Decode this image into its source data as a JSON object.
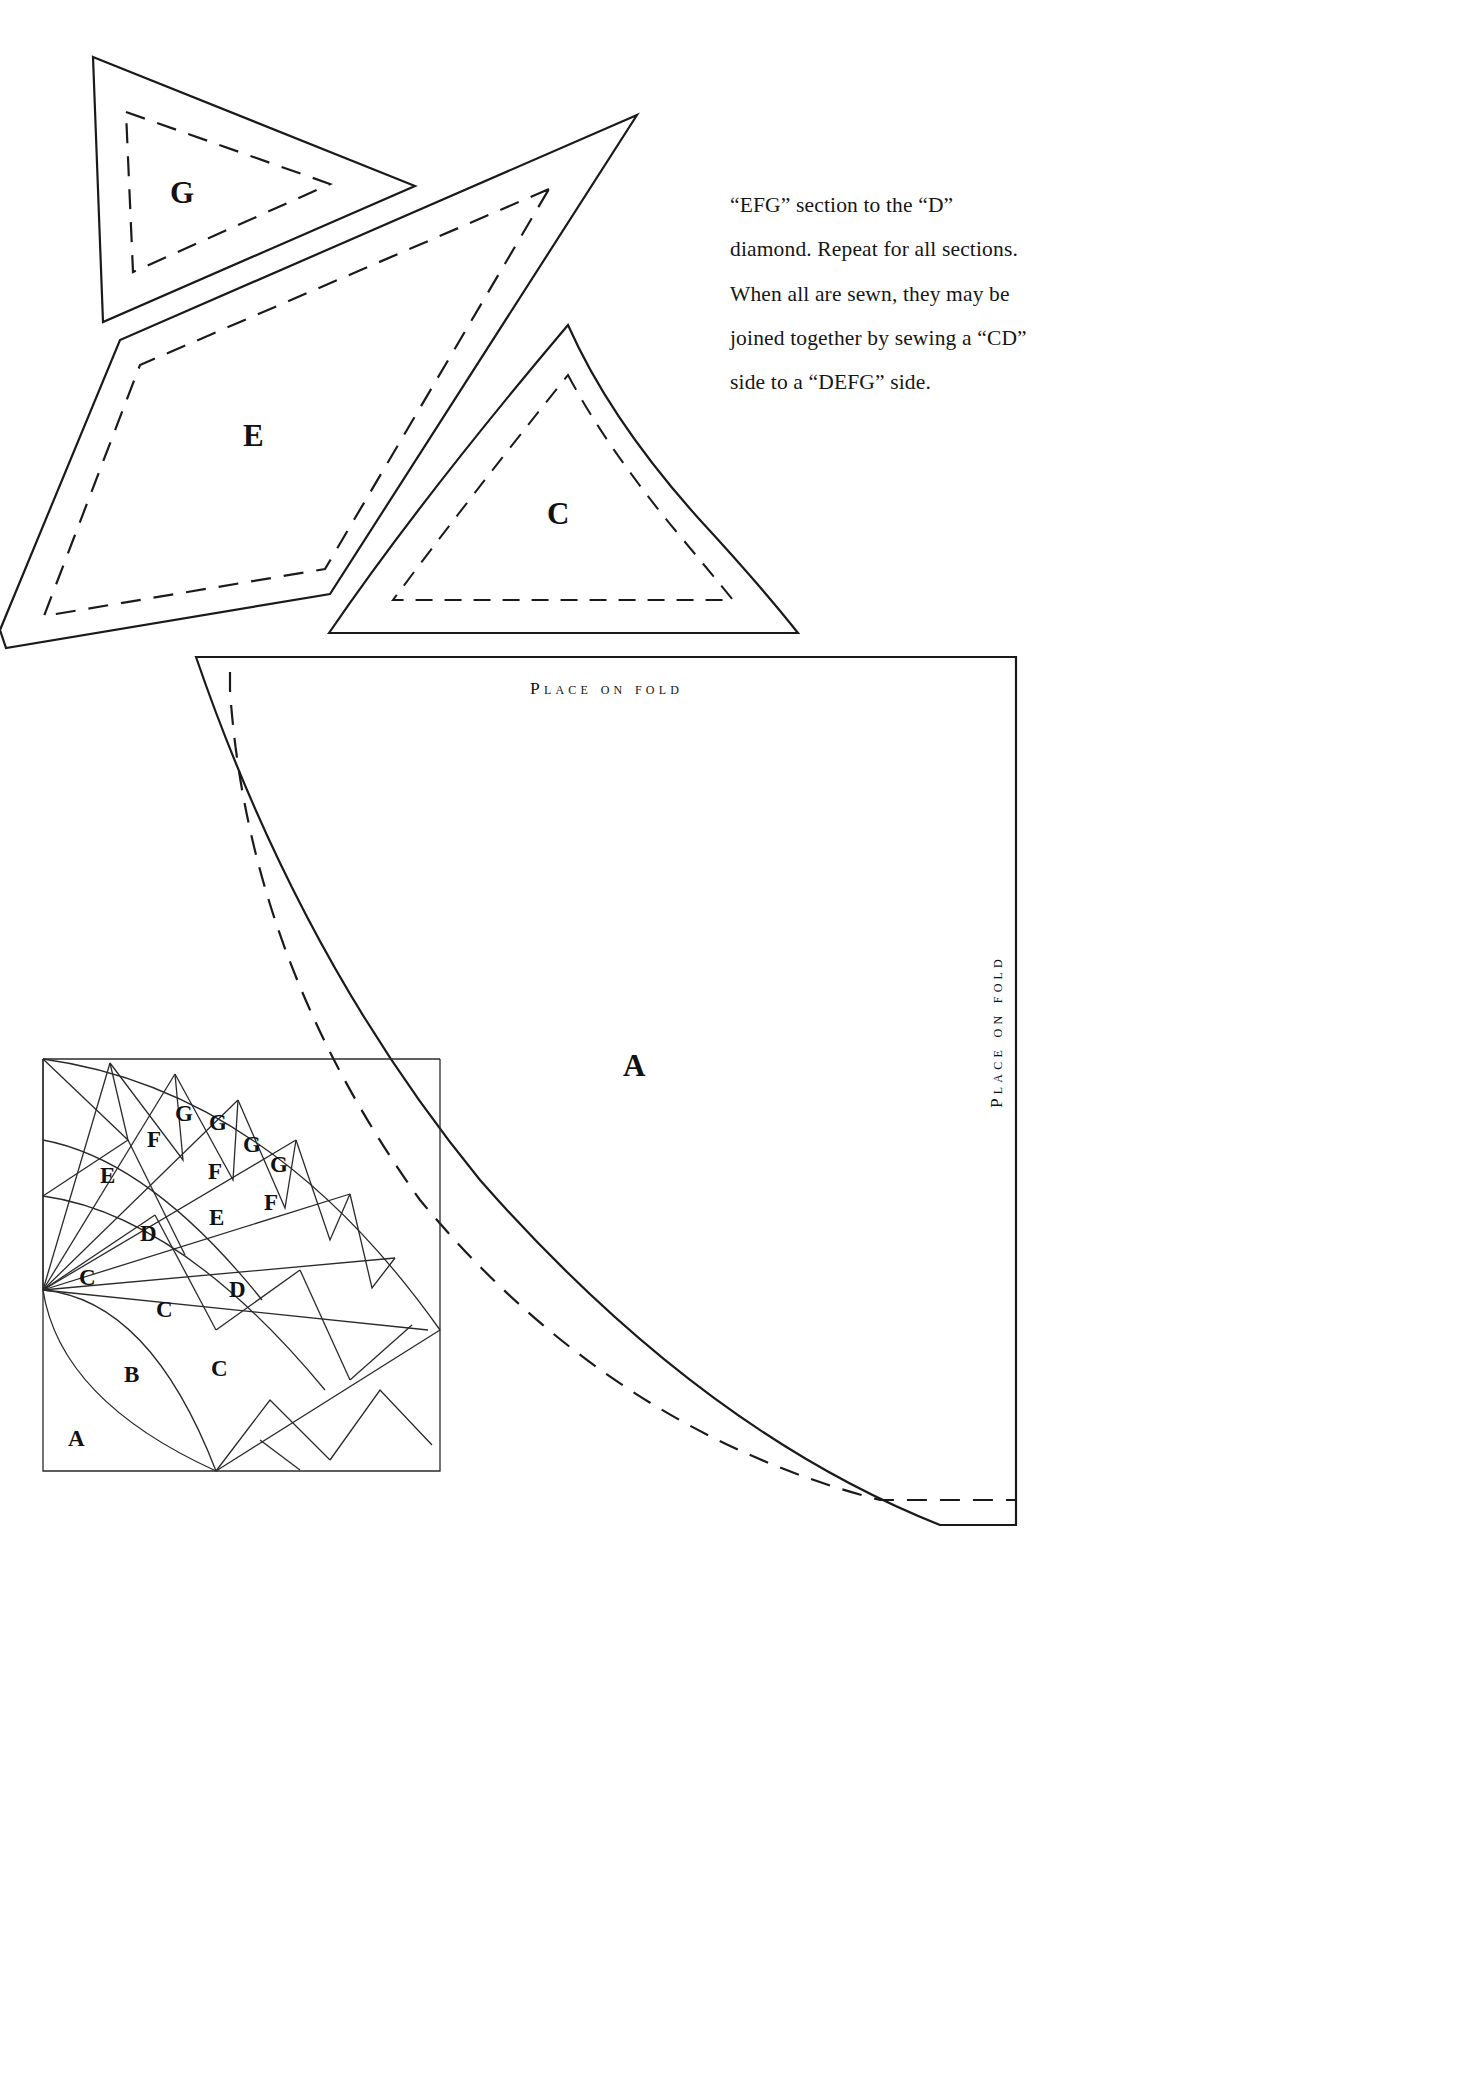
{
  "document": {
    "kind": "quilt-pattern-template-sheet",
    "background": "#ffffff",
    "ink": "#1a1a1a"
  },
  "instructions": {
    "lines": [
      "“EFG” section to the “D”",
      "diamond. Repeat for all sections.",
      "When all are sewn, they may be",
      "joined together by sewing a “CD”",
      "side to a “DEFG” side."
    ]
  },
  "templates": [
    {
      "id": "G",
      "label": "G",
      "note": "small triangle template, top left, solid cut line with dashed seam line"
    },
    {
      "id": "E",
      "label": "E",
      "note": "large elongated triangle template, left, solid cut line with dashed seam line"
    },
    {
      "id": "C",
      "label": "C",
      "note": "triangle template, center, solid cut line with dashed seam line"
    },
    {
      "id": "A",
      "label": "A",
      "note": "large quarter-circle template with place-on-fold edges"
    }
  ],
  "fold_labels": {
    "top": "Place on fold",
    "right": "Place on fold"
  },
  "assembly_diagram": {
    "title": "fan block assembly layout",
    "pieces": [
      {
        "label": "A",
        "x": 68,
        "y": 1426
      },
      {
        "label": "B",
        "x": 124,
        "y": 1362
      },
      {
        "label": "C",
        "x": 79,
        "y": 1265
      },
      {
        "label": "C",
        "x": 156,
        "y": 1297
      },
      {
        "label": "C",
        "x": 211,
        "y": 1356
      },
      {
        "label": "D",
        "x": 140,
        "y": 1221
      },
      {
        "label": "D",
        "x": 229,
        "y": 1277
      },
      {
        "label": "E",
        "x": 100,
        "y": 1163
      },
      {
        "label": "E",
        "x": 209,
        "y": 1205
      },
      {
        "label": "F",
        "x": 147,
        "y": 1127
      },
      {
        "label": "F",
        "x": 208,
        "y": 1159
      },
      {
        "label": "F",
        "x": 264,
        "y": 1190
      },
      {
        "label": "G",
        "x": 175,
        "y": 1101
      },
      {
        "label": "G",
        "x": 209,
        "y": 1110
      },
      {
        "label": "G",
        "x": 243,
        "y": 1132
      },
      {
        "label": "G",
        "x": 270,
        "y": 1152
      }
    ]
  }
}
